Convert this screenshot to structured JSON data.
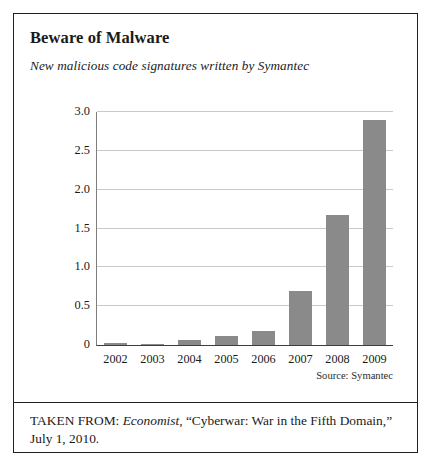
{
  "chart_data": {
    "type": "bar",
    "title": "Beware of Malware",
    "subtitle": "New malicious code signatures written by Symantec",
    "categories": [
      "2002",
      "2003",
      "2004",
      "2005",
      "2006",
      "2007",
      "2008",
      "2009"
    ],
    "values": [
      0.02,
      0.01,
      0.07,
      0.12,
      0.18,
      0.7,
      1.67,
      2.9
    ],
    "xlabel": "",
    "ylabel": "",
    "ylim": [
      0,
      3.0
    ],
    "ytick_labels": [
      "3.0",
      "2.5",
      "2.0",
      "1.5",
      "1.0",
      "0.5",
      "0"
    ],
    "ytick_values": [
      3.0,
      2.5,
      2.0,
      1.5,
      1.0,
      0.5,
      0
    ],
    "grid": true,
    "legend": "none",
    "source_note": "Source: Symantec",
    "bar_color": "#8a8a8a",
    "gridline_color": "#c9c9c9",
    "axis_color": "#3d3d3d"
  },
  "citation": {
    "prefix": "TAKEN FROM: ",
    "publication": "Economist",
    "article": ", “Cyberwar: War in the Fifth Domain,”",
    "date": "July 1, 2010."
  }
}
